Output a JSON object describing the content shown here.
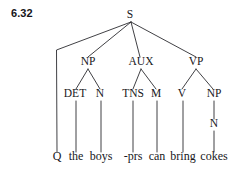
{
  "figure": {
    "example_number": "6.32",
    "type": "syntax-tree-diagram",
    "root_label": "S",
    "nodes": {
      "s": {
        "label": "S",
        "x": 130,
        "y": 18
      },
      "np1": {
        "label": "NP",
        "x": 88,
        "y": 65
      },
      "aux": {
        "label": "AUX",
        "x": 141,
        "y": 65
      },
      "vp": {
        "label": "VP",
        "x": 196,
        "y": 65
      },
      "det": {
        "label": "DET",
        "x": 75,
        "y": 97
      },
      "n1": {
        "label": "N",
        "x": 100,
        "y": 97
      },
      "tns": {
        "label": "TNS",
        "x": 133,
        "y": 97
      },
      "m": {
        "label": "M",
        "x": 156,
        "y": 97
      },
      "v": {
        "label": "V",
        "x": 182,
        "y": 97
      },
      "np2": {
        "label": "NP",
        "x": 214,
        "y": 97
      },
      "n2": {
        "label": "N",
        "x": 214,
        "y": 127
      }
    },
    "terminals": [
      {
        "label": "Q",
        "x": 57,
        "y": 160,
        "parent": "s"
      },
      {
        "label": "the",
        "x": 76,
        "y": 160,
        "parent": "det"
      },
      {
        "label": "boys",
        "x": 101,
        "y": 160,
        "parent": "n1"
      },
      {
        "label": "-prs",
        "x": 133,
        "y": 160,
        "parent": "tns"
      },
      {
        "label": "can",
        "x": 157,
        "y": 160,
        "parent": "m"
      },
      {
        "label": "bring",
        "x": 183,
        "y": 160,
        "parent": "v"
      },
      {
        "label": "cokes",
        "x": 214,
        "y": 160,
        "parent": "np2"
      }
    ],
    "sentence": "Q the boys -prs can bring cokes",
    "colors": {
      "background": "#ffffff",
      "ink": "#17171b",
      "line": "#2b2b30"
    }
  }
}
